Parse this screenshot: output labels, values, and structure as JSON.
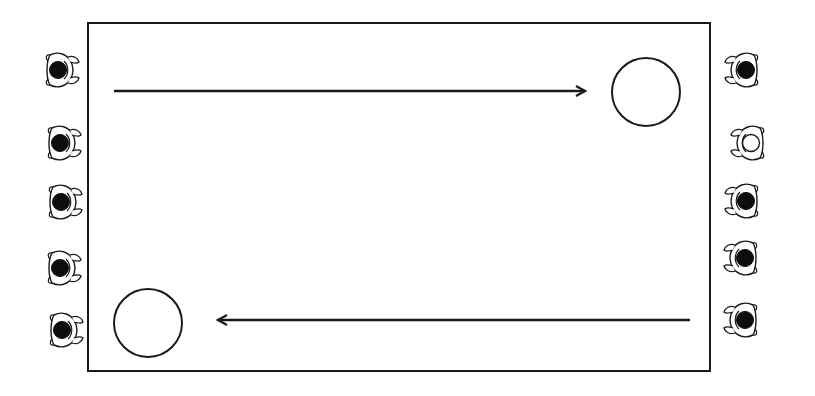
{
  "diagram": {
    "colors": {
      "stroke": "#1a1a1a",
      "fill_dark": "#0d0d0d",
      "background": "#ffffff"
    },
    "field": {
      "x": 88,
      "y": 23,
      "width": 622,
      "height": 348
    },
    "targets": [
      {
        "name": "target-top-right",
        "cx": 646,
        "cy": 92,
        "r": 34
      },
      {
        "name": "target-bottom-left",
        "cx": 148,
        "cy": 323,
        "r": 34
      }
    ],
    "arrows": [
      {
        "name": "arrow-top-left-to-right",
        "x1": 114,
        "y1": 91,
        "x2": 585,
        "y2": 91,
        "direction": "right"
      },
      {
        "name": "arrow-bottom-right-to-left",
        "x1": 690,
        "y1": 320,
        "x2": 218,
        "y2": 320,
        "direction": "left"
      }
    ],
    "people_left": [
      {
        "cx": 60,
        "cy": 70,
        "hair": "dark"
      },
      {
        "cx": 62,
        "cy": 143,
        "hair": "dark"
      },
      {
        "cx": 63,
        "cy": 202,
        "hair": "dark"
      },
      {
        "cx": 62,
        "cy": 268,
        "hair": "dark"
      },
      {
        "cx": 64,
        "cy": 330,
        "hair": "dark"
      }
    ],
    "people_right": [
      {
        "cx": 744,
        "cy": 70,
        "hair": "dark"
      },
      {
        "cx": 750,
        "cy": 143,
        "hair": "light"
      },
      {
        "cx": 744,
        "cy": 201,
        "hair": "dark"
      },
      {
        "cx": 743,
        "cy": 258,
        "hair": "dark"
      },
      {
        "cx": 743,
        "cy": 320,
        "hair": "dark"
      }
    ]
  }
}
